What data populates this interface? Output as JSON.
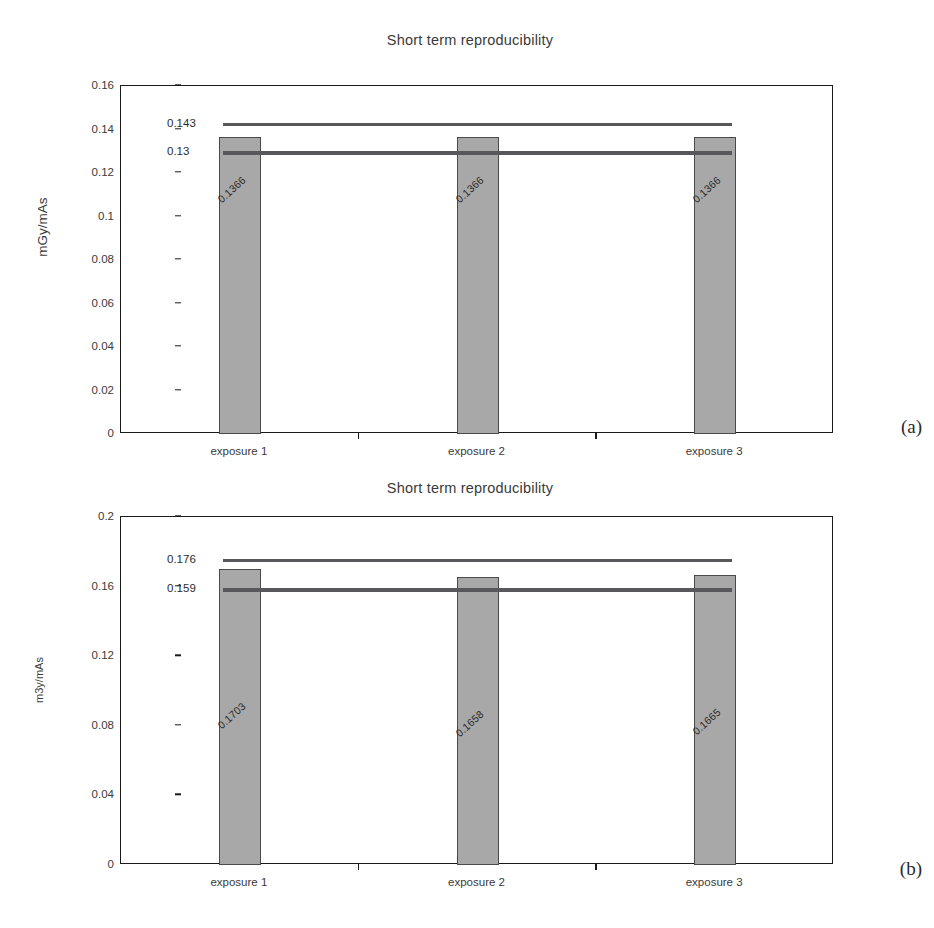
{
  "figures": [
    {
      "panel": "(a)",
      "title": "Short term reproducibility",
      "ylabel": "mGy/mAs"
    },
    {
      "panel": "(b)",
      "title": "Short term reproducibility",
      "ylabel": "m3y/mAs"
    }
  ],
  "chart_data": [
    {
      "type": "bar",
      "title": "Short term reproducibility",
      "xlabel": "",
      "ylabel": "mGy/mAs",
      "categories": [
        "exposure 1",
        "exposure 2",
        "exposure 3"
      ],
      "values": [
        0.1366,
        0.1366,
        0.1366
      ],
      "value_labels": [
        "0.1366",
        "0.1366",
        "0.1366"
      ],
      "ylim": [
        0,
        0.16
      ],
      "yticks": [
        0,
        0.02,
        0.04,
        0.06,
        0.08,
        0.1,
        0.12,
        0.14,
        0.16
      ],
      "ytick_labels": [
        "0",
        "0.02",
        "0.04",
        "0.06",
        "0.08",
        "0.1",
        "0.12",
        "0.14",
        "0.16"
      ],
      "grid": false,
      "legend": "none",
      "reference_lines": [
        {
          "name": "upper-tolerance",
          "value": 0.143,
          "label": "0.143"
        },
        {
          "name": "lower-tolerance",
          "value": 0.13,
          "label": "0.13"
        }
      ],
      "bar_color": "#a8a8a8",
      "bar_edge_color": "#4a4a4a",
      "reference_line_color": "#58585a",
      "axis_color": "#1a1a1a"
    },
    {
      "type": "bar",
      "title": "Short term reproducibility",
      "xlabel": "",
      "ylabel": "m3y/mAs",
      "categories": [
        "exposure 1",
        "exposure 2",
        "exposure 3"
      ],
      "values": [
        0.1703,
        0.1658,
        0.1665
      ],
      "value_labels": [
        "0.1703",
        "0.1658",
        "0.1665"
      ],
      "ylim": [
        0,
        0.2
      ],
      "yticks": [
        0,
        0.04,
        0.08,
        0.12,
        0.16,
        0.2
      ],
      "ytick_labels": [
        "0",
        "0.04",
        "0.08",
        "0.12",
        "0.16",
        "0.2"
      ],
      "grid": false,
      "legend": "none",
      "reference_lines": [
        {
          "name": "upper-tolerance",
          "value": 0.176,
          "label": "0.176"
        },
        {
          "name": "lower-tolerance",
          "value": 0.159,
          "label": "0.159"
        }
      ],
      "bar_color": "#a8a8a8",
      "bar_edge_color": "#4a4a4a",
      "reference_line_color": "#58585a",
      "axis_color": "#1a1a1a"
    }
  ]
}
